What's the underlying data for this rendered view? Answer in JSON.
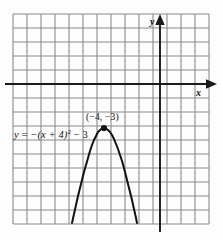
{
  "figure": {
    "background_color": "#fdfdfd",
    "grid": {
      "left": 13,
      "top": 14,
      "cell": 14,
      "cols": 14,
      "rows": 15,
      "line_color": "#8a8a8a",
      "line_width": 1.1
    },
    "axes": {
      "color": "#1a1a1a",
      "line_width": 1.9,
      "x_axis_y_px": 84,
      "y_axis_x_px": 160,
      "x_label": "x",
      "y_label": "y",
      "x_label_name": "x-axis-label",
      "y_label_name": "y-axis-label"
    },
    "equation_label": {
      "prefix": "y",
      "equals": " = ",
      "body": "−(x + 4)",
      "exponent": "2",
      "suffix": " − 3",
      "full_text": "y = −(x + 4)² − 3"
    },
    "vertex_label": {
      "text": "(−4, −3)"
    },
    "vertex_point": {
      "x_px": 104,
      "y_px": 128,
      "radius_px": 3.1,
      "color": "#111111"
    },
    "curve": {
      "color": "#111111",
      "width": 2.0,
      "path": "M 72 223 L 74 214 L 76 205 L 78 196 L 80 188 L 82 180 L 84 172 L 86 165 L 88 158 L 90 151 L 92 145 L 94 140 L 96 136 L 98 132 L 100 130 L 102 128.6 L 104 128.2 L 106 128.6 L 108 130 L 110 132 L 112 135 L 114 139 L 116 144 L 118 149 L 120 155 L 122 161 L 124 168 L 126 176 L 128 184 L 130 192 L 132 200 L 134 209 L 136 218 L 137 223"
    }
  },
  "chart_data": {
    "type": "line",
    "title": "",
    "subtitle": "",
    "xlabel": "x",
    "ylabel": "y",
    "xlim": [
      -10.5,
      3.5
    ],
    "ylim": [
      -10,
      5
    ],
    "grid": true,
    "legend": null,
    "equation": "y = -(x + 4)^2 - 3",
    "vertex": [
      -4,
      -3
    ],
    "opens": "down",
    "annotations": [
      {
        "text": "(−4, −3)",
        "x": -4,
        "y": -3
      },
      {
        "text": "y = −(x + 4)² − 3",
        "x": -9.3,
        "y": -3.6
      }
    ],
    "x": [
      -6.3,
      -6,
      -5.5,
      -5,
      -4.5,
      -4,
      -3.5,
      -3,
      -2.5,
      -2,
      -1.7
    ],
    "y": [
      -8.3,
      -7,
      -5.25,
      -4,
      -3.25,
      -3,
      -3.25,
      -4,
      -5.25,
      -7,
      -8.3
    ],
    "series": [
      {
        "name": "y = -(x + 4)^2 - 3",
        "x": [
          -6.3,
          -6,
          -5.5,
          -5,
          -4.5,
          -4,
          -3.5,
          -3,
          -2.5,
          -2,
          -1.7
        ],
        "values": [
          -8.3,
          -7,
          -5.25,
          -4,
          -3.25,
          -3,
          -3.25,
          -4,
          -5.25,
          -7,
          -8.3
        ]
      }
    ]
  }
}
